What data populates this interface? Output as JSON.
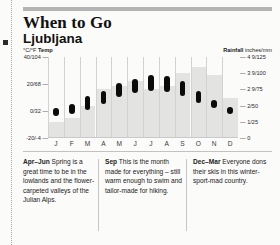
{
  "header": {
    "title": "When to Go",
    "subtitle": "Ljubljana"
  },
  "axes": {
    "left_label_unit": "°C/°F",
    "left_label_name": "Temp",
    "right_label_name": "Rainfall",
    "right_label_unit": "inches/mm",
    "left_ticks": [
      "40/104",
      "20/68",
      "0/32",
      "-20/-4"
    ],
    "right_ticks": [
      "4 9/125",
      "3 9/100",
      "2 9/75",
      "2/50",
      "1/25",
      "0"
    ]
  },
  "chart_data": {
    "type": "bar",
    "subtitle": "Monthly temperature range and rainfall",
    "xlabel": "",
    "ylabel": "°C/°F Temp",
    "y2label": "Rainfall inches/mm",
    "grid": false,
    "legend": "none",
    "categories": [
      "J",
      "F",
      "M",
      "A",
      "M",
      "J",
      "J",
      "A",
      "S",
      "O",
      "N",
      "D"
    ],
    "ylim": [
      -20,
      40
    ],
    "y2lim": [
      0,
      125
    ],
    "series": [
      {
        "name": "Temperature range (°C low–high)",
        "type": "range-bar",
        "low": [
          -4,
          -2,
          1,
          5,
          10,
          13,
          15,
          14,
          11,
          6,
          2,
          -2
        ],
        "high": [
          2,
          5,
          11,
          15,
          21,
          24,
          27,
          26,
          22,
          15,
          8,
          3
        ]
      },
      {
        "name": "Rainfall (mm)",
        "type": "bar",
        "values": [
          25,
          31,
          50,
          75,
          80,
          88,
          75,
          80,
          100,
          110,
          98,
          62
        ]
      }
    ]
  },
  "blurbs": [
    {
      "season": "Apr–Jun",
      "text": "Spring is a great time to be in the lowlands and the flower-carpeted valleys of the Julian Alps."
    },
    {
      "season": "Sep",
      "text": "This is the month made for everything – still warm enough to swim and tailor-made for hiking."
    },
    {
      "season": "Dec–Mar",
      "text": "Everyone dons their skis in this winter-sport-mad country."
    }
  ]
}
